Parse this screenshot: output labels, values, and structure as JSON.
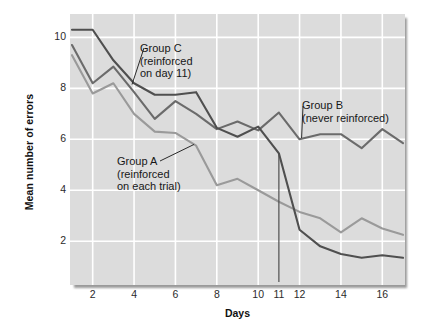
{
  "chart_data": {
    "type": "line",
    "title": "",
    "xlabel": "Days",
    "ylabel": "Mean number of errors",
    "xlim": [
      1,
      17
    ],
    "ylim": [
      0.4,
      10.8
    ],
    "x": [
      1,
      2,
      3,
      4,
      5,
      6,
      7,
      8,
      9,
      10,
      11,
      12,
      13,
      14,
      15,
      16,
      17
    ],
    "xticks": [
      2,
      4,
      6,
      8,
      10,
      11,
      12,
      14,
      16
    ],
    "yticks": [
      2,
      4,
      6,
      8,
      10
    ],
    "grid": "both",
    "grid_color": "#ffffff",
    "plot_background": "#dcdcdc",
    "legend_position": "inline-annotations",
    "series": [
      {
        "name": "Group C",
        "annotation": "Group C\n(reinforced\non day 11)",
        "color": "#4f4f4f",
        "values": [
          10.3,
          10.3,
          9.1,
          8.2,
          7.75,
          7.75,
          7.85,
          6.45,
          6.1,
          6.5,
          5.45,
          2.45,
          1.8,
          1.5,
          1.35,
          1.45,
          1.35
        ]
      },
      {
        "name": "Group B",
        "annotation": "Group B\n(never reinforced)",
        "color": "#6b6b6b",
        "values": [
          9.7,
          8.2,
          8.85,
          7.85,
          6.8,
          7.5,
          7.0,
          6.4,
          6.7,
          6.35,
          7.05,
          6.0,
          6.2,
          6.2,
          5.65,
          6.4,
          5.85
        ]
      },
      {
        "name": "Group A",
        "annotation": "Group A\n(reinforced\non each trial)",
        "color": "#9a9a9a",
        "values": [
          9.3,
          7.8,
          8.2,
          7.0,
          6.3,
          6.25,
          5.75,
          4.2,
          4.45,
          4.0,
          3.55,
          3.15,
          2.9,
          2.35,
          2.9,
          2.5,
          2.25
        ]
      }
    ],
    "marker_line": {
      "name": "day-11-marker",
      "x": 11,
      "y_top": 5.45,
      "y_bottom": 0.4,
      "color": "#4f4f4f"
    }
  },
  "axes": {
    "ylabel": "Mean number of errors",
    "xlabel": "Days",
    "yticks": [
      "10",
      "8",
      "6",
      "4",
      "2"
    ],
    "xticks": [
      "2",
      "4",
      "6",
      "8",
      "10",
      "11",
      "12",
      "14",
      "16"
    ]
  },
  "annotations": {
    "group_c": {
      "line1": "Group C",
      "line2": "(reinforced",
      "line3": "on day 11)"
    },
    "group_b": {
      "line1": "Group B",
      "line2": "(never reinforced)"
    },
    "group_a": {
      "line1": "Group A",
      "line2": "(reinforced",
      "line3": "on each trial)"
    }
  }
}
